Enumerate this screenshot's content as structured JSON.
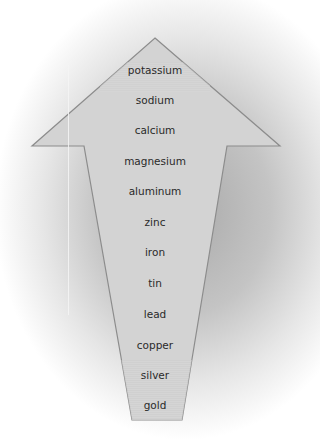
{
  "diagram": {
    "title": "",
    "shape": "up-arrow",
    "colors": {
      "fill": "#d2d2d2",
      "stroke": "#8c8c8c",
      "text": "#2a2a2a",
      "band": "#c6c6c6"
    },
    "items": [
      {
        "label": "potassium",
        "y": 70
      },
      {
        "label": "sodium",
        "y": 100
      },
      {
        "label": "calcium",
        "y": 130
      },
      {
        "label": "magnesium",
        "y": 161
      },
      {
        "label": "aluminum",
        "y": 191
      },
      {
        "label": "zinc",
        "y": 222
      },
      {
        "label": "iron",
        "y": 252
      },
      {
        "label": "tin",
        "y": 283
      },
      {
        "label": "lead",
        "y": 314
      },
      {
        "label": "copper",
        "y": 345
      },
      {
        "label": "silver",
        "y": 375
      },
      {
        "label": "gold",
        "y": 405
      }
    ]
  }
}
